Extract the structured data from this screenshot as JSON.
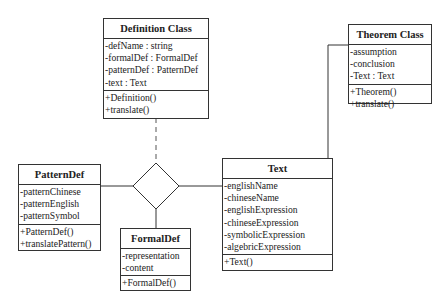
{
  "classes": {
    "definition": {
      "name": "Definition Class",
      "attributes": [
        "-defName : string",
        "-formalDef : FormalDef",
        "-patternDef : PatternDef",
        "-text : Text"
      ],
      "methods": [
        "+Definition()",
        "+translate()"
      ]
    },
    "theorem": {
      "name": "Theorem Class",
      "attributes": [
        "-assumption",
        "-conclusion",
        "-Text : Text"
      ],
      "methods": [
        "+Theorem()",
        "+translate()"
      ]
    },
    "patterndef": {
      "name": "PatternDef",
      "attributes": [
        "-patternChinese",
        "-patternEnglish",
        "-patternSymbol"
      ],
      "methods": [
        "+PatternDef()",
        "+translatePattern()"
      ]
    },
    "formaldef": {
      "name": "FormalDef",
      "attributes": [
        "-representation",
        "-content"
      ],
      "methods": [
        "+FormalDef()"
      ]
    },
    "text": {
      "name": "Text",
      "attributes": [
        "-englishName",
        "-chineseName",
        "-englishExpression",
        "-chineseExpression",
        "-symbolicExpression",
        "-algebricExpression"
      ],
      "methods": [
        "+Text()"
      ]
    }
  },
  "relations": [
    {
      "type": "dashed",
      "from": "Definition Class",
      "to": "association-diamond"
    },
    {
      "type": "solid",
      "from": "PatternDef",
      "to": "association-diamond"
    },
    {
      "type": "solid",
      "from": "FormalDef",
      "to": "association-diamond"
    },
    {
      "type": "solid",
      "from": "Text",
      "to": "association-diamond"
    },
    {
      "type": "solid",
      "from": "Text",
      "to": "Theorem Class"
    }
  ]
}
